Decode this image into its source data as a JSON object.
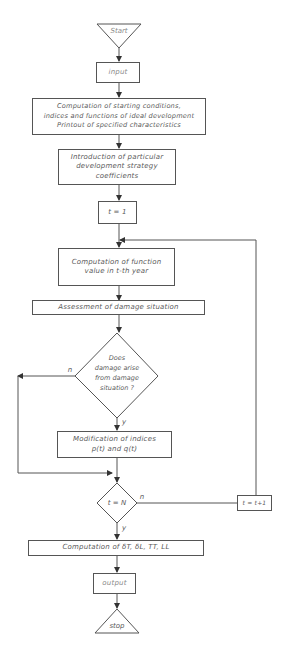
{
  "flowchart": {
    "start": "Start",
    "input": "input",
    "init": "Computation of starting conditions,\nindices and functions of ideal development\nPrintout of specified characteristics",
    "strategy": "Introduction of particular\ndevelopment  strategy\ncoefficients",
    "t_init": "t = 1",
    "compute_function": "Computation of function\nvalue in t-th year",
    "assessment": "Assessment of damage situation",
    "decision_damage": "Does\ndamage arise\nfrom damage\nsituation ?",
    "decision_damage_no": "n",
    "decision_damage_yes": "y",
    "modification": "Modification of indices\np(t) and q(t)",
    "decision_end": "t = N",
    "decision_end_no": "n",
    "decision_end_yes": "y",
    "increment": "t = t+1",
    "final_computation": "Computation of  δT, δL, TT, LL",
    "output": "output",
    "stop": "stop"
  },
  "colors": {
    "line": "#555555",
    "text": "#5a5a5a",
    "background": "#ffffff"
  }
}
